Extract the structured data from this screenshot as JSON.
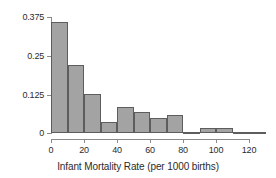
{
  "chart_data": {
    "type": "bar",
    "title": "",
    "subtitle": "",
    "xlabel": "Infant Mortality Rate (per 1000 births)",
    "ylabel": "",
    "xlim": [
      -5,
      137
    ],
    "ylim": [
      0,
      0.39
    ],
    "grid": false,
    "legend": null,
    "bin_width": 10,
    "x_ticks": [
      {
        "value": 0,
        "label": "0"
      },
      {
        "value": 20,
        "label": "20"
      },
      {
        "value": 40,
        "label": "40"
      },
      {
        "value": 60,
        "label": "60"
      },
      {
        "value": 80,
        "label": "80"
      },
      {
        "value": 100,
        "label": "100"
      },
      {
        "value": 120,
        "label": "120"
      }
    ],
    "y_ticks": [
      {
        "value": 0,
        "label": "0"
      },
      {
        "value": 0.125,
        "label": "0.125"
      },
      {
        "value": 0.25,
        "label": "0.25"
      },
      {
        "value": 0.375,
        "label": "0.375"
      }
    ],
    "bin_edges": [
      0,
      10,
      20,
      30,
      40,
      50,
      60,
      70,
      80,
      90,
      100,
      110,
      120,
      130
    ],
    "categories": [
      "0-10",
      "10-20",
      "20-30",
      "30-40",
      "40-50",
      "50-60",
      "60-70",
      "70-80",
      "80-90",
      "90-100",
      "100-110",
      "110-120",
      "120-130"
    ],
    "values": [
      0.36,
      0.22,
      0.125,
      0.035,
      0.085,
      0.068,
      0.048,
      0.058,
      0.005,
      0.015,
      0.015,
      0.002,
      0.005
    ],
    "bar_fill_color": "#a3a3a3",
    "bar_edge_color": "#5d5d5d",
    "axis_color": "#8a8a8a",
    "text_color": "#2b2b2b",
    "background_color": "#ffffff"
  }
}
